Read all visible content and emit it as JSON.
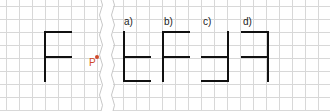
{
  "figure": {
    "point_label": "P",
    "point_color": "#d04a2a",
    "options": [
      {
        "label": "a)"
      },
      {
        "label": "b)"
      },
      {
        "label": "c)"
      },
      {
        "label": "d)"
      }
    ]
  }
}
